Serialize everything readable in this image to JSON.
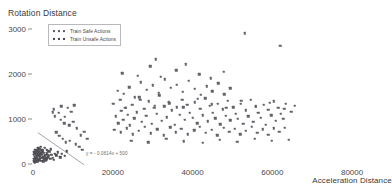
{
  "chart_data": {
    "type": "scatter",
    "title": "",
    "xlabel": "Acceleration Distance",
    "ylabel": "Rotation Distance",
    "xlim": [
      0,
      88000
    ],
    "ylim": [
      0,
      3150
    ],
    "xticks": [
      "0",
      "20000",
      "40000",
      "60000",
      "80000"
    ],
    "xtick_values": [
      0,
      20000,
      40000,
      60000,
      80000
    ],
    "yticks": [
      "0",
      "1000",
      "2000",
      "3000"
    ],
    "ytick_values": [
      0,
      1000,
      2000,
      3000
    ],
    "grid": false,
    "legend_position": "upper-left",
    "annotation": "y = - 0.0614x + 500",
    "trendline": {
      "slope": -0.0614,
      "intercept": 500,
      "x_start": 1200,
      "x_end": 12800
    },
    "series": [
      {
        "name": "Train Safe Actions",
        "marker": "dot",
        "color": "#63636a",
        "points": [
          [
            20800,
            1060
          ],
          [
            21400,
            900
          ],
          [
            22100,
            1180
          ],
          [
            22600,
            980
          ],
          [
            23100,
            1250
          ],
          [
            21900,
            1420
          ],
          [
            23800,
            1090
          ],
          [
            24300,
            860
          ],
          [
            24900,
            1310
          ],
          [
            25400,
            1010
          ],
          [
            26100,
            1150
          ],
          [
            26700,
            1480
          ],
          [
            27300,
            940
          ],
          [
            27900,
            1220
          ],
          [
            28400,
            1070
          ],
          [
            29100,
            1390
          ],
          [
            29800,
            890
          ],
          [
            30400,
            1240
          ],
          [
            31000,
            1110
          ],
          [
            31700,
            1520
          ],
          [
            32300,
            960
          ],
          [
            32900,
            1280
          ],
          [
            33600,
            1040
          ],
          [
            34200,
            1350
          ],
          [
            34800,
            1190
          ],
          [
            35500,
            870
          ],
          [
            36100,
            1260
          ],
          [
            36800,
            1090
          ],
          [
            37400,
            1430
          ],
          [
            38000,
            980
          ],
          [
            38700,
            1310
          ],
          [
            39300,
            1140
          ],
          [
            40000,
            1020
          ],
          [
            40600,
            1370
          ],
          [
            41200,
            900
          ],
          [
            41900,
            1230
          ],
          [
            42500,
            1080
          ],
          [
            43200,
            1460
          ],
          [
            43800,
            950
          ],
          [
            44400,
            1290
          ],
          [
            45100,
            1130
          ],
          [
            45700,
            1010
          ],
          [
            46400,
            1340
          ],
          [
            47000,
            880
          ],
          [
            47600,
            1210
          ],
          [
            48300,
            1070
          ],
          [
            48900,
            1400
          ],
          [
            49500,
            970
          ],
          [
            50200,
            1260
          ],
          [
            50800,
            1120
          ],
          [
            51400,
            1000
          ],
          [
            52100,
            1330
          ],
          [
            52700,
            890
          ],
          [
            53300,
            1190
          ],
          [
            54000,
            1060
          ],
          [
            54600,
            1420
          ],
          [
            55200,
            940
          ],
          [
            55900,
            1270
          ],
          [
            56500,
            1140
          ],
          [
            57100,
            1020
          ],
          [
            57800,
            1310
          ],
          [
            58400,
            870
          ],
          [
            59000,
            1200
          ],
          [
            59700,
            1080
          ],
          [
            60300,
            1390
          ],
          [
            60900,
            960
          ],
          [
            61500,
            1240
          ],
          [
            62200,
            1110
          ],
          [
            62800,
            1000
          ],
          [
            63400,
            1330
          ],
          [
            21200,
            1620
          ],
          [
            22800,
            1560
          ],
          [
            24100,
            1700
          ],
          [
            25600,
            1480
          ],
          [
            27000,
            1810
          ],
          [
            28600,
            1640
          ],
          [
            30100,
            1750
          ],
          [
            31500,
            1580
          ],
          [
            33000,
            1880
          ],
          [
            34500,
            1690
          ],
          [
            36000,
            1760
          ],
          [
            37500,
            1600
          ],
          [
            39000,
            1840
          ],
          [
            40500,
            1670
          ],
          [
            42000,
            1540
          ],
          [
            43500,
            1720
          ],
          [
            45000,
            1610
          ],
          [
            46500,
            1790
          ],
          [
            48000,
            1550
          ],
          [
            49500,
            1680
          ],
          [
            22400,
            2010
          ],
          [
            26300,
            1960
          ],
          [
            29400,
            2170
          ],
          [
            32100,
            1930
          ],
          [
            35900,
            2080
          ],
          [
            38300,
            2210
          ],
          [
            41700,
            1990
          ],
          [
            44600,
            1900
          ],
          [
            47800,
            2040
          ],
          [
            30800,
            2320
          ],
          [
            53100,
            2900
          ],
          [
            62000,
            2620
          ],
          [
            20400,
            760
          ],
          [
            22000,
            700
          ],
          [
            23500,
            790
          ],
          [
            25000,
            660
          ],
          [
            26500,
            740
          ],
          [
            28000,
            820
          ],
          [
            29500,
            680
          ],
          [
            31200,
            770
          ],
          [
            32800,
            640
          ],
          [
            34400,
            810
          ],
          [
            35800,
            700
          ],
          [
            37200,
            780
          ],
          [
            38800,
            660
          ],
          [
            40400,
            750
          ],
          [
            41800,
            830
          ],
          [
            43400,
            690
          ],
          [
            44800,
            760
          ],
          [
            46200,
            640
          ],
          [
            47800,
            800
          ],
          [
            49200,
            710
          ],
          [
            50600,
            780
          ],
          [
            52000,
            660
          ],
          [
            53400,
            740
          ],
          [
            54800,
            820
          ],
          [
            56200,
            690
          ],
          [
            57600,
            770
          ],
          [
            59000,
            650
          ],
          [
            60400,
            790
          ],
          [
            61800,
            720
          ],
          [
            63200,
            800
          ],
          [
            24600,
            520
          ],
          [
            28900,
            480
          ],
          [
            33400,
            560
          ],
          [
            37800,
            500
          ],
          [
            42600,
            470
          ],
          [
            46900,
            540
          ],
          [
            51200,
            490
          ],
          [
            55600,
            560
          ],
          [
            59800,
            510
          ],
          [
            64200,
            530
          ],
          [
            20100,
            1340
          ],
          [
            23200,
            1240
          ],
          [
            26900,
            1420
          ],
          [
            30600,
            1290
          ],
          [
            34100,
            1380
          ],
          [
            37700,
            1260
          ],
          [
            41300,
            1450
          ],
          [
            44900,
            1320
          ],
          [
            48500,
            1240
          ],
          [
            52200,
            1400
          ],
          [
            55800,
            1280
          ],
          [
            59400,
            1360
          ],
          [
            63000,
            1230
          ],
          [
            64800,
            1160
          ],
          [
            65600,
            1290
          ],
          [
            5200,
            1210
          ],
          [
            6400,
            1130
          ],
          [
            7100,
            1280
          ],
          [
            8000,
            1050
          ],
          [
            8800,
            1240
          ],
          [
            9600,
            1160
          ],
          [
            10400,
            1300
          ],
          [
            6900,
            980
          ],
          [
            7800,
            900
          ],
          [
            9100,
            860
          ],
          [
            10100,
            940
          ],
          [
            11000,
            790
          ],
          [
            5800,
            700
          ],
          [
            6600,
            620
          ],
          [
            7400,
            560
          ],
          [
            8200,
            480
          ],
          [
            9200,
            520
          ],
          [
            10800,
            440
          ],
          [
            11600,
            380
          ],
          [
            12400,
            320
          ],
          [
            4900,
            1150
          ],
          [
            5500,
            1060
          ],
          [
            12000,
            640
          ],
          [
            12900,
            720
          ],
          [
            13600,
            560
          ]
        ]
      },
      {
        "name": "Train Unsafe Actions",
        "marker": "dot",
        "color": "#4f4f55",
        "points": [
          [
            300,
            60
          ],
          [
            600,
            90
          ],
          [
            900,
            50
          ],
          [
            1200,
            120
          ],
          [
            1500,
            80
          ],
          [
            1800,
            140
          ],
          [
            2100,
            70
          ],
          [
            2400,
            160
          ],
          [
            2700,
            100
          ],
          [
            3000,
            180
          ],
          [
            3300,
            130
          ],
          [
            3600,
            200
          ],
          [
            400,
            150
          ],
          [
            700,
            200
          ],
          [
            1000,
            170
          ],
          [
            1300,
            230
          ],
          [
            1600,
            190
          ],
          [
            1900,
            250
          ],
          [
            2200,
            210
          ],
          [
            2500,
            270
          ],
          [
            2800,
            160
          ],
          [
            3100,
            120
          ],
          [
            3400,
            90
          ],
          [
            3700,
            150
          ],
          [
            200,
            110
          ],
          [
            500,
            40
          ],
          [
            800,
            130
          ],
          [
            1100,
            60
          ],
          [
            1400,
            180
          ],
          [
            1700,
            100
          ],
          [
            2000,
            220
          ],
          [
            2300,
            140
          ],
          [
            2600,
            60
          ],
          [
            2900,
            200
          ],
          [
            3200,
            80
          ],
          [
            3500,
            240
          ],
          [
            4000,
            170
          ],
          [
            4300,
            110
          ],
          [
            4600,
            200
          ],
          [
            4900,
            140
          ],
          [
            5200,
            90
          ],
          [
            5500,
            230
          ],
          [
            1000,
            300
          ],
          [
            1600,
            340
          ],
          [
            2300,
            310
          ],
          [
            3000,
            360
          ],
          [
            3800,
            290
          ],
          [
            4500,
            330
          ],
          [
            600,
            260
          ],
          [
            1300,
            280
          ],
          [
            2000,
            380
          ],
          [
            2700,
            250
          ],
          [
            3400,
            320
          ],
          [
            4100,
            270
          ],
          [
            150,
            200
          ],
          [
            350,
            260
          ],
          [
            550,
            320
          ],
          [
            750,
            240
          ],
          [
            950,
            280
          ],
          [
            1150,
            210
          ],
          [
            1350,
            350
          ],
          [
            1550,
            270
          ],
          [
            1750,
            190
          ],
          [
            1950,
            310
          ],
          [
            2150,
            240
          ],
          [
            2350,
            290
          ],
          [
            5800,
            190
          ],
          [
            6200,
            260
          ],
          [
            6800,
            150
          ],
          [
            7200,
            230
          ],
          [
            7900,
            180
          ],
          [
            8400,
            280
          ]
        ]
      }
    ]
  },
  "legend": {
    "items": [
      {
        "label": "Train Safe Actions"
      },
      {
        "label": "Train Unsafe Actions"
      }
    ]
  }
}
